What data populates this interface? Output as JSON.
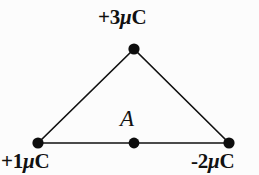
{
  "figure": {
    "background_color": "#fcfcfc",
    "stroke_color": "#111111"
  },
  "labels": {
    "top_charge": "+3μC",
    "left_charge": "+1μC",
    "right_charge": "-2μC",
    "point_a": "A"
  },
  "label_parts": {
    "top": {
      "sign": "+",
      "magnitude": "3",
      "mu": "μ",
      "unit": "C"
    },
    "left": {
      "sign": "+",
      "magnitude": "1",
      "mu": "μ",
      "unit": "C"
    },
    "right": {
      "sign": "-",
      "magnitude": "2",
      "mu": "μ",
      "unit": "C"
    }
  },
  "geometry": {
    "apex": {
      "x": 134,
      "y": 49
    },
    "bottom_left": {
      "x": 38,
      "y": 143
    },
    "bottom_right": {
      "x": 229,
      "y": 143
    },
    "midpoint_a": {
      "x": 134,
      "y": 143
    },
    "dot_radius": 5.5,
    "line_width": 1.6
  }
}
